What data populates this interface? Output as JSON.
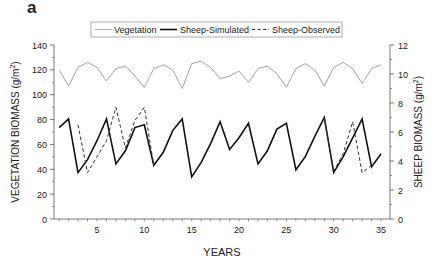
{
  "panel_label": "a",
  "chart_data": {
    "type": "line",
    "title": "",
    "xlabel": "YEARS",
    "ylabel": "VEGETATION BIOMASS (g/m2)",
    "y2label": "SHEEP BIOMASS (g/m2)",
    "xlim": [
      0.5,
      35.5
    ],
    "ylim": [
      0,
      140
    ],
    "y2lim": [
      0,
      12
    ],
    "xticks": [
      5,
      10,
      15,
      20,
      25,
      30,
      35
    ],
    "yticks": [
      0,
      20,
      40,
      60,
      80,
      100,
      120,
      140
    ],
    "y2ticks": [
      0,
      2,
      4,
      6,
      8,
      10,
      12
    ],
    "grid": false,
    "legend_position": "top",
    "x": [
      1,
      2,
      3,
      4,
      5,
      6,
      7,
      8,
      9,
      10,
      11,
      12,
      13,
      14,
      15,
      16,
      17,
      18,
      19,
      20,
      21,
      22,
      23,
      24,
      25,
      26,
      27,
      28,
      29,
      30,
      31,
      32,
      33,
      34,
      35
    ],
    "series": [
      {
        "name": "Vegetation",
        "axis": "left",
        "style": "thin-gray",
        "color": "#9a9a9a",
        "values": [
          120,
          107,
          122,
          126,
          122,
          111,
          121,
          123,
          115,
          106,
          121,
          124,
          120,
          105,
          125,
          127,
          122,
          113,
          115,
          119,
          110,
          121,
          123,
          117,
          106,
          121,
          125,
          120,
          107,
          122,
          126,
          121,
          109,
          121,
          124
        ]
      },
      {
        "name": "Sheep-Simulated",
        "axis": "right",
        "style": "solid",
        "color": "#111111",
        "values": [
          6.3,
          6.9,
          3.2,
          4.1,
          5.4,
          6.9,
          3.8,
          4.7,
          6.3,
          6.5,
          3.7,
          4.6,
          6.1,
          6.9,
          2.9,
          3.9,
          5.2,
          6.7,
          4.8,
          5.6,
          6.6,
          3.8,
          4.7,
          6.2,
          6.6,
          3.4,
          4.3,
          5.7,
          7.0,
          3.2,
          4.3,
          5.6,
          6.9,
          3.6,
          4.5
        ]
      },
      {
        "name": "Sheep-Observed",
        "axis": "right",
        "style": "dashed",
        "color": "#333333",
        "segments": [
          {
            "x": [
              3,
              4,
              5,
              6,
              7,
              8,
              9,
              10,
              11
            ],
            "values": [
              6.5,
              3.2,
              4.3,
              5.4,
              7.7,
              4.9,
              6.8,
              7.7,
              3.7
            ]
          },
          {
            "x": [
              29,
              30,
              31,
              32,
              33,
              34
            ],
            "values": [
              7.0,
              3.3,
              4.5,
              6.7,
              3.2,
              3.7
            ]
          }
        ]
      }
    ]
  },
  "legend": {
    "items": [
      {
        "label": "Vegetation",
        "style": "thin-gray"
      },
      {
        "label": "Sheep-Simulated",
        "style": "solid"
      },
      {
        "label": "Sheep-Observed",
        "style": "dashed"
      }
    ]
  },
  "axes": {
    "left_label_main": "VEGETATION BIOMASS (g/m",
    "left_label_sup": "2",
    "left_label_end": ")",
    "right_label_main": "SHEEP BIOMASS (g/m",
    "right_label_sup": "2",
    "right_label_end": ")",
    "x_label": "YEARS"
  }
}
